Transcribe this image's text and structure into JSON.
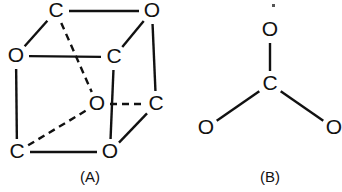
{
  "figure": {
    "background_color": "#ffffff",
    "ink_color": "#111111",
    "width": 342,
    "height": 192,
    "panels": [
      {
        "id": "panel-a",
        "caption": "(A)",
        "caption_pos": {
          "x": 90,
          "y": 178
        },
        "kind": "cubic-lattice",
        "description": "Cube drawn in parallel perspective with alternating C and O atoms at the eight corners; hidden rear edges drawn dashed.",
        "atoms": [
          {
            "id": "a-top-back-left",
            "label": "C",
            "x": 56,
            "y": 11
          },
          {
            "id": "a-top-back-right",
            "label": "O",
            "x": 152,
            "y": 11
          },
          {
            "id": "a-top-front-left",
            "label": "O",
            "x": 16,
            "y": 56
          },
          {
            "id": "a-top-front-right",
            "label": "C",
            "x": 114,
            "y": 57
          },
          {
            "id": "a-bot-back-left",
            "label": "O",
            "x": 97,
            "y": 104
          },
          {
            "id": "a-bot-back-right",
            "label": "C",
            "x": 156,
            "y": 104
          },
          {
            "id": "a-bot-front-left",
            "label": "C",
            "x": 17,
            "y": 152
          },
          {
            "id": "a-bot-front-right",
            "label": "O",
            "x": 110,
            "y": 152
          }
        ],
        "bonds": [
          {
            "from": "a-top-back-left",
            "to": "a-top-back-right",
            "style": "solid"
          },
          {
            "from": "a-top-front-left",
            "to": "a-top-front-right",
            "style": "solid"
          },
          {
            "from": "a-bot-front-left",
            "to": "a-bot-front-right",
            "style": "solid"
          },
          {
            "from": "a-bot-back-left",
            "to": "a-bot-back-right",
            "style": "dashed"
          },
          {
            "from": "a-top-front-left",
            "to": "a-bot-front-left",
            "style": "solid"
          },
          {
            "from": "a-top-front-right",
            "to": "a-bot-front-right",
            "style": "solid"
          },
          {
            "from": "a-top-back-right",
            "to": "a-bot-back-right",
            "style": "solid"
          },
          {
            "from": "a-top-back-left",
            "to": "a-bot-back-left",
            "style": "dashed"
          },
          {
            "from": "a-top-front-left",
            "to": "a-top-back-left",
            "style": "solid"
          },
          {
            "from": "a-top-front-right",
            "to": "a-top-back-right",
            "style": "solid"
          },
          {
            "from": "a-bot-front-right",
            "to": "a-bot-back-right",
            "style": "solid"
          },
          {
            "from": "a-bot-front-left",
            "to": "a-bot-back-left",
            "style": "dashed"
          }
        ]
      },
      {
        "id": "panel-b",
        "caption": "(B)",
        "caption_pos": {
          "x": 270,
          "y": 178
        },
        "kind": "trigonal-planar",
        "description": "Trigonal planar carbonate-style unit: one central C bonded to three O atoms at roughly 120 degrees.",
        "atoms": [
          {
            "id": "b-center",
            "label": "C",
            "x": 270,
            "y": 84
          },
          {
            "id": "b-oxygen-top",
            "label": "O",
            "x": 270,
            "y": 30
          },
          {
            "id": "b-oxygen-left",
            "label": "O",
            "x": 206,
            "y": 128
          },
          {
            "id": "b-oxygen-right",
            "label": "O",
            "x": 334,
            "y": 128
          }
        ],
        "bonds": [
          {
            "from": "b-center",
            "to": "b-oxygen-top",
            "style": "solid"
          },
          {
            "from": "b-center",
            "to": "b-oxygen-left",
            "style": "solid"
          },
          {
            "from": "b-center",
            "to": "b-oxygen-right",
            "style": "solid"
          }
        ]
      }
    ],
    "specks": [
      {
        "id": "speck-top",
        "x": 272,
        "y": 4,
        "w": 3,
        "h": 3
      }
    ]
  }
}
